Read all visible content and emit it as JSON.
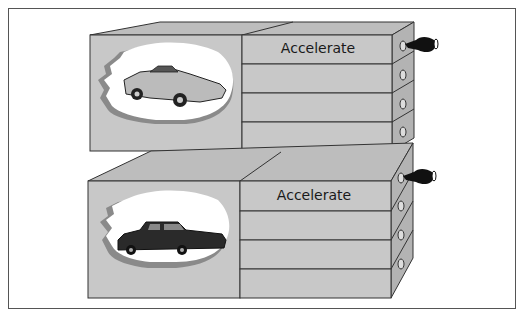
{
  "diagram": {
    "boxes": [
      {
        "id": "top",
        "vehicle": "sports-car",
        "drawers": [
          {
            "label": "Accelerate",
            "handle": "hand-pulling"
          },
          {
            "label": "",
            "handle": "knob"
          },
          {
            "label": "",
            "handle": "knob"
          },
          {
            "label": "",
            "handle": "knob"
          }
        ]
      },
      {
        "id": "bottom",
        "vehicle": "limousine",
        "drawers": [
          {
            "label": "Accelerate",
            "handle": "hand-pulling"
          },
          {
            "label": "",
            "handle": "knob"
          },
          {
            "label": "",
            "handle": "knob"
          },
          {
            "label": "",
            "handle": "knob"
          }
        ]
      }
    ],
    "colors": {
      "box_face": "#c8c8c8",
      "box_top": "#bdbdbd",
      "box_side": "#b3b3b3",
      "outline": "#333333",
      "cutout": "#ffffff",
      "cutout_edge": "#8a8a8a",
      "hand": "#111111"
    }
  }
}
